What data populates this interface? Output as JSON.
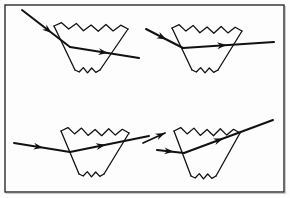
{
  "figure": {
    "caption": "",
    "background_color": "#fdfdfd",
    "ink_color": "#111111",
    "frame": {
      "name": "outer-border",
      "x": 5,
      "y": 5,
      "width": 279,
      "height": 187,
      "stroke": "#2b2b2b",
      "stroke_width": 1.4,
      "fill": "#fdfdfd",
      "outer_shadow_color": "#c9c9c9"
    },
    "panel_count": 4,
    "panels": [
      {
        "id": "panel-top-left",
        "label": "top-left",
        "description": "Steeply descending incident ray refracts at the left face, travels nearly horizontally inside the prism and exits slightly downward to the right.",
        "prism": {
          "name": "prism-top-left",
          "top_left": [
            54,
            26
          ],
          "top_right": [
            128,
            29
          ],
          "bottom_right": [
            100,
            70
          ],
          "bottom_left": [
            75,
            70
          ],
          "wavy_top": true,
          "wavy_bottom": true,
          "top_wave_count": 5,
          "bottom_wave_count": 3,
          "stroke_width": 1.3
        },
        "rays": [
          {
            "name": "incident-ray",
            "points": [
              [
                22,
                10
              ],
              [
                70,
                47
              ]
            ],
            "arrow_at": 0.62,
            "arrow_at_end": false,
            "stroke_width": 2.0
          },
          {
            "name": "refracted-exit-ray",
            "points": [
              [
                70,
                47
              ],
              [
                139,
                58
              ]
            ],
            "arrow_at": 0.55,
            "arrow_at_end": true,
            "stroke_width": 2.0
          }
        ]
      },
      {
        "id": "panel-top-right",
        "label": "top-right",
        "description": "Shallow descending incident ray refracts at the left face, crosses the prism horizontally and exits ascending to the upper right.",
        "prism": {
          "name": "prism-top-right",
          "top_left": [
            172,
            28
          ],
          "top_right": [
            242,
            31
          ],
          "bottom_right": [
            218,
            70
          ],
          "bottom_left": [
            192,
            70
          ],
          "wavy_top": true,
          "wavy_bottom": true,
          "top_wave_count": 5,
          "bottom_wave_count": 3,
          "stroke_width": 1.3
        },
        "rays": [
          {
            "name": "incident-ray",
            "points": [
              [
                146,
                29
              ],
              [
                183,
                48
              ]
            ],
            "arrow_at": 0.55,
            "arrow_at_end": false,
            "stroke_width": 2.0
          },
          {
            "name": "refracted-exit-ray",
            "points": [
              [
                183,
                48
              ],
              [
                274,
                42
              ]
            ],
            "arrow_at": 0.48,
            "arrow_at_end": true,
            "stroke_width": 2.0
          }
        ]
      },
      {
        "id": "panel-bottom-left",
        "label": "bottom-left",
        "description": "Nearly horizontal incident ray enters the left face and exits upward to the right at a moderate angle.",
        "prism": {
          "name": "prism-bottom-left",
          "top_left": [
            61,
            131
          ],
          "top_right": [
            129,
            133
          ],
          "bottom_right": [
            104,
            174
          ],
          "bottom_left": [
            79,
            174
          ],
          "wavy_top": true,
          "wavy_bottom": true,
          "top_wave_count": 5,
          "bottom_wave_count": 3,
          "stroke_width": 1.3
        },
        "rays": [
          {
            "name": "incident-ray",
            "points": [
              [
                14,
                143
              ],
              [
                70,
                152
              ]
            ],
            "arrow_at": 0.52,
            "arrow_at_end": false,
            "stroke_width": 2.0
          },
          {
            "name": "refracted-exit-ray",
            "points": [
              [
                70,
                152
              ],
              [
                149,
                136
              ]
            ],
            "arrow_at": 0.45,
            "arrow_at_end": true,
            "stroke_width": 2.0
          }
        ]
      },
      {
        "id": "panel-bottom-right",
        "label": "bottom-right",
        "description": "Horizontal incident ray enters the left face and exits steeply upward to the right; a short auxiliary arrow appears at the lower left.",
        "prism": {
          "name": "prism-bottom-right",
          "top_left": [
            174,
            131
          ],
          "top_right": [
            240,
            133
          ],
          "bottom_right": [
            216,
            176
          ],
          "bottom_left": [
            191,
            176
          ],
          "wavy_top": true,
          "wavy_bottom": true,
          "top_wave_count": 5,
          "bottom_wave_count": 3,
          "stroke_width": 1.3
        },
        "rays": [
          {
            "name": "incident-ray",
            "points": [
              [
                157,
                150
              ],
              [
                184,
                153
              ]
            ],
            "arrow_at": 0.62,
            "arrow_at_end": false,
            "stroke_width": 2.0
          },
          {
            "name": "refracted-exit-ray",
            "points": [
              [
                184,
                153
              ],
              [
                273,
                120
              ]
            ],
            "arrow_at": 0.44,
            "arrow_at_end": true,
            "stroke_width": 2.0
          },
          {
            "name": "auxiliary-arrow",
            "points": [
              [
                143,
                143
              ],
              [
                165,
                133
              ]
            ],
            "arrow_at": 1.0,
            "arrow_at_end": true,
            "stroke_width": 1.8,
            "standalone": true
          }
        ]
      }
    ]
  }
}
